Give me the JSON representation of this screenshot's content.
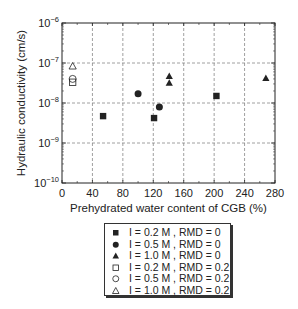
{
  "chart_data": {
    "type": "scatter",
    "title": "",
    "xlabel": "Prehydrated water content of CGB (%)",
    "ylabel": "Hydraulic conductivity (cm/s)",
    "xlim": [
      0,
      280
    ],
    "ylim": [
      1e-10,
      1e-06
    ],
    "yscale": "log",
    "xticks": [
      0,
      40,
      80,
      120,
      160,
      200,
      240,
      280
    ],
    "xtick_labels": [
      "0",
      "40",
      "80",
      "120",
      "160",
      "200",
      "240",
      "280"
    ],
    "yticks": [
      1e-10,
      1e-09,
      1e-08,
      1e-07,
      1e-06
    ],
    "ytick_labels": [
      {
        "base": "10",
        "exp": "−10"
      },
      {
        "base": "10",
        "exp": "−9"
      },
      {
        "base": "10",
        "exp": "−8"
      },
      {
        "base": "10",
        "exp": "−7"
      },
      {
        "base": "10",
        "exp": "−6"
      }
    ],
    "grid": true,
    "legend_position": "below",
    "series": [
      {
        "name": "I = 0.2 M , RMD = 0",
        "marker": "square",
        "filled": true,
        "points": [
          [
            54,
            4.7e-09
          ],
          [
            121,
            4.2e-09
          ],
          [
            203,
            1.5e-08
          ]
        ]
      },
      {
        "name": "I = 0.5 M , RMD = 0",
        "marker": "circle",
        "filled": true,
        "points": [
          [
            100,
            1.7e-08
          ],
          [
            128,
            7.9e-09
          ]
        ]
      },
      {
        "name": "I = 1.0 M , RMD = 0",
        "marker": "triangle",
        "filled": true,
        "points": [
          [
            141,
            4.7e-08
          ],
          [
            141,
            3.2e-08
          ],
          [
            268,
            4.2e-08
          ]
        ]
      },
      {
        "name": "I = 0.2 M , RMD = 0.2",
        "marker": "square",
        "filled": false,
        "points": [
          [
            14,
            3.3e-08
          ]
        ]
      },
      {
        "name": "I = 0.5 M , RMD = 0.2",
        "marker": "circle",
        "filled": false,
        "points": [
          [
            14,
            4e-08
          ]
        ]
      },
      {
        "name": "I = 1.0 M , RMD = 0.2",
        "marker": "triangle",
        "filled": false,
        "points": [
          [
            14,
            8.4e-08
          ]
        ]
      }
    ]
  },
  "legend": {
    "items": [
      {
        "label": "I = 0.2 M , RMD = 0",
        "marker": "square",
        "filled": true
      },
      {
        "label": "I = 0.5 M , RMD = 0",
        "marker": "circle",
        "filled": true
      },
      {
        "label": "I = 1.0 M , RMD = 0",
        "marker": "triangle",
        "filled": true
      },
      {
        "label": "I = 0.2 M , RMD = 0.2",
        "marker": "square",
        "filled": false
      },
      {
        "label": "I = 0.5 M , RMD = 0.2",
        "marker": "circle",
        "filled": false
      },
      {
        "label": "I = 1.0 M , RMD = 0.2",
        "marker": "triangle",
        "filled": false
      }
    ]
  },
  "colors": {
    "ink": "#222222",
    "grid": "#888888",
    "background": "#ffffff"
  }
}
